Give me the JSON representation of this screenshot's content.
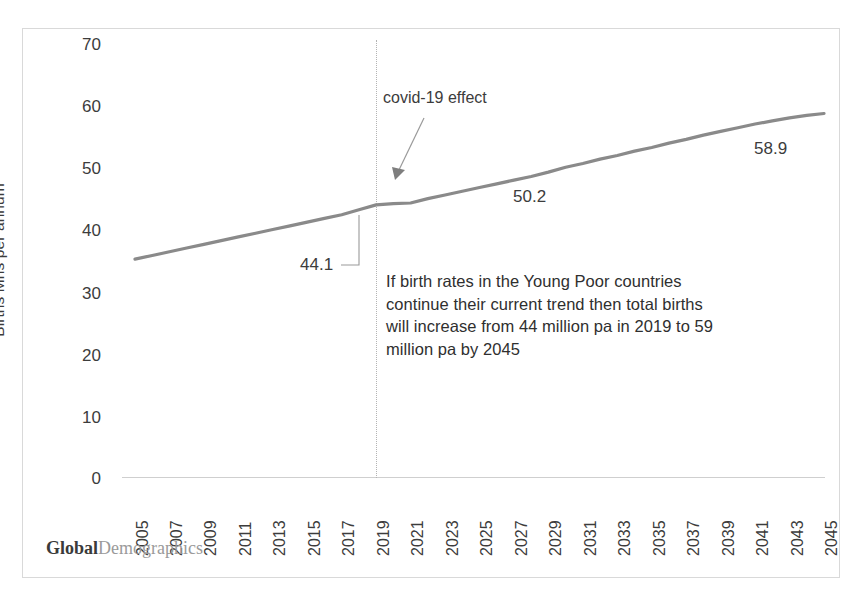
{
  "logo": {
    "bold_part": "Global",
    "light_part": "Demographics"
  },
  "annotations": {
    "covid_label": "covid-19 effect",
    "body_text": "If birth rates in the Young Poor countries continue their current trend then total births will increase from 44 million pa in 2019 to 59 million pa by 2045",
    "value_2019": "44.1",
    "value_mid": "50.2",
    "value_2045": "58.9"
  },
  "colors": {
    "line": "#8a8a8a",
    "text": "#3c3c3c",
    "axis": "#cfcfcf",
    "gridline": "#b4b4b4",
    "frame": "#d9d9d9"
  },
  "chart_data": {
    "type": "line",
    "title": "",
    "xlabel": "",
    "ylabel": "Births Mns per annum",
    "ylim": [
      0,
      70
    ],
    "yticks": [
      0,
      10,
      20,
      30,
      40,
      50,
      60,
      70
    ],
    "ytick_labels": [
      "0",
      "10",
      "20",
      "30",
      "40",
      "50",
      "60",
      "70"
    ],
    "xtick_labels": [
      "2005",
      "2007",
      "2009",
      "2011",
      "2013",
      "2015",
      "2017",
      "2019",
      "2021",
      "2023",
      "2025",
      "2027",
      "2029",
      "2031",
      "2033",
      "2035",
      "2037",
      "2039",
      "2041",
      "2043",
      "2045"
    ],
    "xlim": [
      2005,
      2045
    ],
    "grid": false,
    "legend": null,
    "series": [
      {
        "name": "Total births",
        "x": [
          2005,
          2006,
          2007,
          2008,
          2009,
          2010,
          2011,
          2012,
          2013,
          2014,
          2015,
          2016,
          2017,
          2018,
          2019,
          2020,
          2021,
          2022,
          2023,
          2024,
          2025,
          2026,
          2027,
          2028,
          2029,
          2030,
          2031,
          2032,
          2033,
          2034,
          2035,
          2036,
          2037,
          2038,
          2039,
          2040,
          2041,
          2042,
          2043,
          2044,
          2045
        ],
        "values": [
          35.3,
          35.9,
          36.5,
          37.1,
          37.7,
          38.3,
          38.9,
          39.5,
          40.1,
          40.7,
          41.3,
          41.9,
          42.5,
          43.3,
          44.1,
          44.3,
          44.4,
          45.1,
          45.7,
          46.3,
          46.9,
          47.5,
          48.1,
          48.7,
          49.4,
          50.2,
          50.8,
          51.5,
          52.1,
          52.8,
          53.4,
          54.1,
          54.7,
          55.4,
          56.0,
          56.6,
          57.2,
          57.7,
          58.2,
          58.6,
          58.9
        ]
      }
    ],
    "data_labels": [
      {
        "label": "44.1",
        "x": 2019,
        "y": 44.1
      },
      {
        "label": "50.2",
        "x": 2030,
        "y": 50.2
      },
      {
        "label": "58.9",
        "x": 2045,
        "y": 58.9
      }
    ],
    "marker_line": {
      "x": 2020,
      "note": "covid-19 effect"
    }
  }
}
